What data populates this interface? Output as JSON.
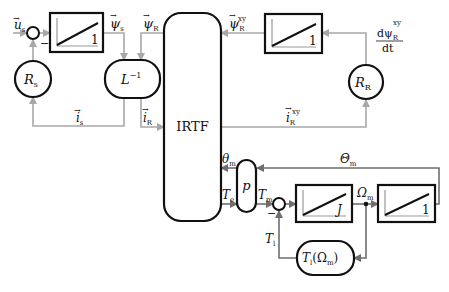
{
  "diagram": {
    "type": "block-diagram",
    "blocks": {
      "integrator_stator": {
        "gain_label": "1"
      },
      "stator_resistance": {
        "label": "R",
        "sub": "s"
      },
      "inverse_inductance": {
        "label": "L",
        "sup": "−1"
      },
      "irtf": {
        "label": "IRTF"
      },
      "integrator_rotor": {
        "gain_label": "1"
      },
      "rotor_resistance": {
        "label": "R",
        "sub": "R"
      },
      "pole_pairs": {
        "label": "p"
      },
      "inertia_integrator": {
        "gain_label": "J"
      },
      "position_integrator": {
        "gain_label": "1"
      },
      "load_torque": {
        "label": "T",
        "sub": "l",
        "arg": "(Ω",
        "arg_sub": "m",
        "close": ")"
      }
    },
    "signals": {
      "u_s": {
        "label": "u",
        "sub": "s",
        "vector": true
      },
      "psi_s": {
        "label": "ψ",
        "sub": "s",
        "vector": true
      },
      "psi_R": {
        "label": "ψ",
        "sub": "R",
        "vector": true
      },
      "psi_R_xy": {
        "label": "ψ",
        "sub": "R",
        "sup": "xy",
        "vector": true
      },
      "dpsi_dt_num": {
        "label": "dψ",
        "sub": "R",
        "sup": "xy"
      },
      "dpsi_dt_den": {
        "label": "dt"
      },
      "i_s": {
        "label": "i",
        "sub": "s",
        "vector": true
      },
      "i_R": {
        "label": "i",
        "sub": "R",
        "vector": true
      },
      "i_R_xy": {
        "label": "i",
        "sub": "R",
        "sup": "xy",
        "vector": true
      },
      "theta_m": {
        "label": "θ",
        "sub": "m"
      },
      "Theta_m": {
        "label": "Θ",
        "sub": "m"
      },
      "T_e": {
        "label": "T",
        "sub": "e"
      },
      "T_m": {
        "label": "T",
        "sub": "m"
      },
      "Omega_m": {
        "label": "Ω",
        "sub": "m"
      },
      "T_l": {
        "label": "T",
        "sub": "l"
      }
    },
    "summing_signs": {
      "stator_minus": "−",
      "mech_minus": "−"
    },
    "colors": {
      "block_stroke": "#111111",
      "electrical_signal": "#a8a8a8",
      "mechanical_signal": "#6e6e6e",
      "background": "#ffffff"
    }
  }
}
